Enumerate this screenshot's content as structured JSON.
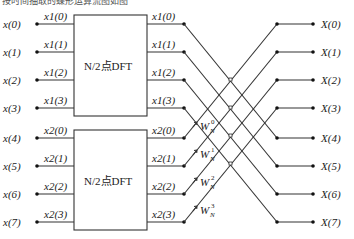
{
  "header_partial": "按时间抽取的蝶形运算流图如图",
  "inputs": [
    "x(0)",
    "x(1)",
    "x(2)",
    "x(3)",
    "x(4)",
    "x(5)",
    "x(6)",
    "x(7)"
  ],
  "box_inputs_upper": [
    "x1(0)",
    "x1(1)",
    "x1(2)",
    "x1(3)"
  ],
  "box_inputs_lower": [
    "x2(0)",
    "x2(1)",
    "x2(2)",
    "x2(3)"
  ],
  "box_outputs_upper": [
    "x1(0)",
    "x1(1)",
    "x1(2)",
    "x1(3)"
  ],
  "box_outputs_lower": [
    "x2(0)",
    "x2(1)",
    "x2(2)",
    "x2(3)"
  ],
  "dft_blocks": [
    {
      "label": "N/2点DFT"
    },
    {
      "label": "N/2点DFT"
    }
  ],
  "twiddles": [
    {
      "base": "W",
      "sub": "N",
      "sup": "0"
    },
    {
      "base": "W",
      "sub": "N",
      "sup": "1"
    },
    {
      "base": "W",
      "sub": "N",
      "sup": "2"
    },
    {
      "base": "W",
      "sub": "N",
      "sup": "3"
    }
  ],
  "outputs": [
    "X(0)",
    "X(1)",
    "X(2)",
    "X(3)",
    "X(4)",
    "X(5)",
    "X(6)",
    "X(7)"
  ]
}
